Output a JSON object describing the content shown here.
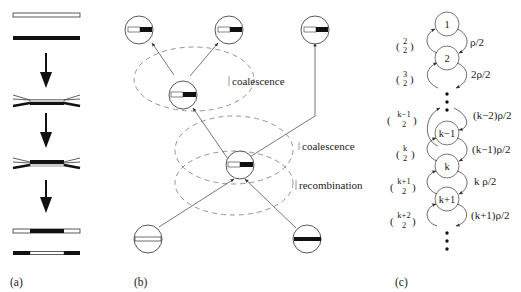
{
  "figure": {
    "panels": {
      "a": {
        "label": "(a)",
        "description": "recombination of two chromosomes: white and black strands cross over"
      },
      "b": {
        "label": "(b)",
        "events": {
          "coalescence_top": "coalescence",
          "coalescence_mid": "coalescence",
          "recombination": "recombination"
        }
      },
      "c": {
        "label": "(c)",
        "states": [
          "1",
          "2",
          "k−1",
          "k",
          "k+1"
        ],
        "down_rates": [
          "ρ/2",
          "2ρ/2",
          "(k−2)ρ/2",
          "(k−1)ρ/2",
          "k ρ/2",
          "(k+1)ρ/2"
        ],
        "up_rates": [
          {
            "top": "2",
            "bottom": "2"
          },
          {
            "top": "3",
            "bottom": "2"
          },
          {
            "top": "k−1",
            "bottom": "2"
          },
          {
            "top": "k",
            "bottom": "2"
          },
          {
            "top": "k+1",
            "bottom": "2"
          },
          {
            "top": "k+2",
            "bottom": "2"
          }
        ]
      }
    },
    "colors": {
      "ink": "#222222",
      "dashed": "#888888",
      "background": "#ffffff"
    }
  }
}
